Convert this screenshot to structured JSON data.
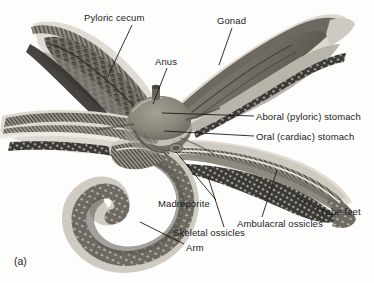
{
  "figure": {
    "caption_label": "(a)",
    "palette": {
      "background": "#fdfdfc",
      "leader_line": "#1a1a1a",
      "text": "#1a1a1a",
      "body_light": "#d9d5cc",
      "body_mid": "#a8a296",
      "body_dark": "#6f6a61",
      "body_darkest": "#3a3732",
      "gonad": "#8a8479",
      "disc": "#8e8madeup"
    }
  },
  "labels": [
    {
      "id": "pyloric-cecum",
      "text": "Pyloric cecum",
      "x": 84,
      "y": 13,
      "leader": {
        "x1": 132,
        "y1": 25,
        "x2": 108,
        "y2": 76
      }
    },
    {
      "id": "gonad",
      "text": "Gonad",
      "x": 217,
      "y": 16,
      "leader": {
        "x1": 232,
        "y1": 28,
        "x2": 219,
        "y2": 65
      }
    },
    {
      "id": "anus",
      "text": "Anus",
      "x": 155,
      "y": 57,
      "leader": {
        "x1": 167,
        "y1": 68,
        "x2": 153,
        "y2": 104
      }
    },
    {
      "id": "aboral-pyloric-stomach",
      "text": "Aboral (pyloric) stomach",
      "x": 256,
      "y": 112,
      "leader": {
        "x1": 254,
        "y1": 116,
        "x2": 162,
        "y2": 113
      }
    },
    {
      "id": "oral-cardiac-stomach",
      "text": "Oral (cardiac) stomach",
      "x": 256,
      "y": 132,
      "leader": {
        "x1": 254,
        "y1": 136,
        "x2": 164,
        "y2": 131
      }
    },
    {
      "id": "madreporite",
      "text": "Madreporite",
      "x": 158,
      "y": 199,
      "leader": {
        "x1": 216,
        "y1": 200,
        "x2": 176,
        "y2": 152
      }
    },
    {
      "id": "skeletal-ossicles",
      "text": "Skeletal ossicles",
      "x": 173,
      "y": 228,
      "leader": {
        "x1": 224,
        "y1": 227,
        "x2": 208,
        "y2": 177
      }
    },
    {
      "id": "ambulacral-ossicles",
      "text": "Ambulacral ossicles",
      "x": 237,
      "y": 219,
      "leader": {
        "x1": 262,
        "y1": 217,
        "x2": 277,
        "y2": 170
      }
    },
    {
      "id": "tube-feet",
      "text": "Tube feet",
      "x": 320,
      "y": 207,
      "leader": {
        "x1": 318,
        "y1": 209,
        "x2": 296,
        "y2": 196
      }
    },
    {
      "id": "arm",
      "text": "Arm",
      "x": 186,
      "y": 243,
      "leader": {
        "x1": 184,
        "y1": 244,
        "x2": 140,
        "y2": 222
      }
    }
  ]
}
